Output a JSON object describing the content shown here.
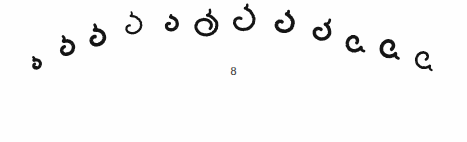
{
  "figure": {
    "kind": "scanned-handwritten-figure",
    "background_color": "#fefefe",
    "ink_color": "#141414",
    "width": 467,
    "height": 142,
    "description_label": "arc of hand-drawn spiral loop glyphs",
    "glyph_count": 12,
    "arc_orientation": "opening-downward",
    "glyphs": [
      {
        "index": 1,
        "name": "spiral-glyph-1",
        "cx": 36,
        "cy": 65,
        "rx": 6.0,
        "ry": 5.2,
        "rotation": -34,
        "stroke": 3.0,
        "tail": 1.0,
        "sweep": 330,
        "inner": 0.3
      },
      {
        "index": 2,
        "name": "spiral-glyph-2",
        "cx": 66,
        "cy": 49,
        "rx": 9.5,
        "ry": 8.2,
        "rotation": -28,
        "stroke": 3.4,
        "tail": 1.0,
        "sweep": 345,
        "inner": 0.34
      },
      {
        "index": 3,
        "name": "spiral-glyph-3",
        "cx": 96,
        "cy": 39,
        "rx": 10.5,
        "ry": 9.0,
        "rotation": -20,
        "stroke": 3.6,
        "tail": 1.0,
        "sweep": 350,
        "inner": 0.3
      },
      {
        "index": 4,
        "name": "spiral-glyph-4",
        "cx": 131,
        "cy": 27,
        "rx": 13.0,
        "ry": 11.0,
        "rotation": -12,
        "stroke": 2.2,
        "tail": 0.6,
        "sweep": 330,
        "inner": 0.18
      },
      {
        "index": 5,
        "name": "spiral-glyph-5",
        "cx": 170,
        "cy": 25,
        "rx": 9.0,
        "ry": 8.0,
        "rotation": -6,
        "stroke": 3.2,
        "tail": 0.4,
        "sweep": 340,
        "inner": 0.2
      },
      {
        "index": 6,
        "name": "spiral-glyph-6",
        "cx": 205,
        "cy": 26,
        "rx": 13.0,
        "ry": 11.0,
        "rotation": 2,
        "stroke": 3.0,
        "tail": 0.9,
        "sweep": 470,
        "inner": 0.45
      },
      {
        "index": 7,
        "name": "spiral-glyph-7",
        "cx": 241,
        "cy": 21,
        "rx": 15.5,
        "ry": 13.5,
        "rotation": 8,
        "stroke": 3.0,
        "tail": 0.5,
        "sweep": 345,
        "inner": 0.18
      },
      {
        "index": 8,
        "name": "spiral-glyph-8",
        "cx": 282,
        "cy": 24,
        "rx": 13.0,
        "ry": 11.0,
        "rotation": 14,
        "stroke": 3.6,
        "tail": 0.5,
        "sweep": 340,
        "inner": 0.2
      },
      {
        "index": 9,
        "name": "spiral-glyph-9",
        "cx": 320,
        "cy": 32,
        "rx": 11.0,
        "ry": 9.5,
        "rotation": 24,
        "stroke": 3.4,
        "tail": 1.1,
        "sweep": 350,
        "inner": 0.3
      },
      {
        "index": 10,
        "name": "spiral-glyph-10",
        "cx": 354,
        "cy": 42,
        "rx": 10.0,
        "ry": 9.0,
        "rotation": 118,
        "stroke": 3.4,
        "tail": 0.9,
        "sweep": 340,
        "inner": 0.32
      },
      {
        "index": 11,
        "name": "spiral-glyph-11",
        "cx": 389,
        "cy": 47,
        "rx": 10.5,
        "ry": 9.5,
        "rotation": 126,
        "stroke": 3.6,
        "tail": 1.0,
        "sweep": 355,
        "inner": 0.36
      },
      {
        "index": 12,
        "name": "spiral-glyph-12",
        "cx": 424,
        "cy": 58,
        "rx": 11.0,
        "ry": 10.0,
        "rotation": 134,
        "stroke": 2.6,
        "tail": 0.8,
        "sweep": 345,
        "inner": 0.24
      }
    ]
  },
  "page_number": {
    "text": "8",
    "x": 171,
    "y": 65
  }
}
